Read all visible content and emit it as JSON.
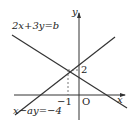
{
  "diagram": {
    "line1_label": "2x+3y=b",
    "line2_label": "x−ay=−4",
    "axis_x": "x",
    "axis_y": "y",
    "origin": "O",
    "tick_x": "−1",
    "tick_y": "2",
    "intersection": {
      "x": -1,
      "y": 2
    }
  }
}
